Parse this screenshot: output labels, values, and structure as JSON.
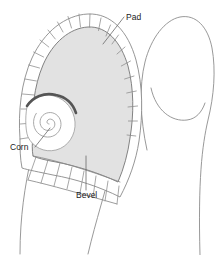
{
  "figure": {
    "background_color": "#ffffff",
    "width": 216,
    "height": 255
  },
  "colors": {
    "pad_fill": "#e2e2e2",
    "pad_outline": "#6e6e6e",
    "bevel_fill": "#ffffff",
    "bevel_outline": "#8a8a8a",
    "corn_ring": "#555555",
    "corn_spiral": "#9a9a9a",
    "toe_outline": "#8d8d8d",
    "label_color": "#1b1b1b",
    "leader_color": "#6a6a6a"
  },
  "labels": [
    {
      "id": "pad",
      "text": "Pad",
      "x": 126,
      "y": 20,
      "anchor": "start",
      "leader": {
        "x1": 124,
        "y1": 17,
        "x2": 103,
        "y2": 44
      }
    },
    {
      "id": "corn",
      "text": "Corn",
      "x": 10,
      "y": 150,
      "anchor": "start",
      "leader": {
        "x1": 35,
        "y1": 147,
        "x2": 50,
        "y2": 128
      }
    },
    {
      "id": "bevel",
      "text": "Bevel",
      "x": 76,
      "y": 198,
      "anchor": "start",
      "leader": {
        "x1": 86,
        "y1": 190,
        "x2": 86,
        "y2": 156
      }
    }
  ],
  "parts": {
    "pad_name": "pad-region",
    "bevel_name": "bevel-region",
    "corn_name": "corn-lesion",
    "toe_name": "toe-outline"
  }
}
